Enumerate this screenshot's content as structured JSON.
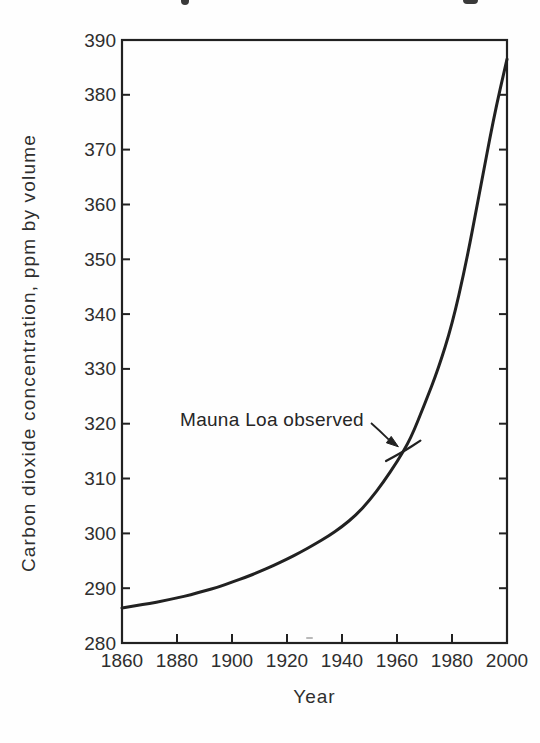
{
  "chart_data": {
    "type": "line",
    "title": "",
    "xlabel": "Year",
    "ylabel": "Carbon dioxide concentration, ppm by volume",
    "xlim": [
      1860,
      2000
    ],
    "ylim": [
      280,
      390
    ],
    "xticks": [
      1860,
      1880,
      1900,
      1920,
      1940,
      1960,
      1980,
      2000
    ],
    "yticks": [
      280,
      290,
      300,
      310,
      320,
      330,
      340,
      350,
      360,
      370,
      380,
      390
    ],
    "grid": false,
    "frame": "full-box",
    "legend": "none",
    "ink_color": "#212121",
    "text_color": "#2e2e2e",
    "series": [
      {
        "name": "CO2 concentration curve",
        "points": [
          [
            1860,
            286.4
          ],
          [
            1865,
            286.8
          ],
          [
            1870,
            287.2
          ],
          [
            1875,
            287.7
          ],
          [
            1880,
            288.2
          ],
          [
            1885,
            288.8
          ],
          [
            1890,
            289.5
          ],
          [
            1895,
            290.2
          ],
          [
            1900,
            291.1
          ],
          [
            1905,
            292.0
          ],
          [
            1910,
            293.0
          ],
          [
            1915,
            294.1
          ],
          [
            1920,
            295.3
          ],
          [
            1925,
            296.6
          ],
          [
            1930,
            298.0
          ],
          [
            1935,
            299.5
          ],
          [
            1940,
            301.2
          ],
          [
            1945,
            303.3
          ],
          [
            1950,
            306.0
          ],
          [
            1955,
            309.3
          ],
          [
            1960,
            313.0
          ],
          [
            1965,
            317.3
          ],
          [
            1970,
            323.5
          ],
          [
            1975,
            330.0
          ],
          [
            1980,
            338.0
          ],
          [
            1985,
            349.0
          ],
          [
            1990,
            362.0
          ],
          [
            1995,
            375.5
          ],
          [
            2000,
            386.5
          ]
        ]
      },
      {
        "name": "Mauna Loa observed segment",
        "points": [
          [
            1956,
            313.2
          ],
          [
            1962,
            314.8
          ],
          [
            1968.5,
            316.9
          ]
        ]
      }
    ],
    "annotation": {
      "text": "Mauna Loa observed",
      "target": {
        "year": 1960.5,
        "ppm": 315.8
      }
    }
  }
}
